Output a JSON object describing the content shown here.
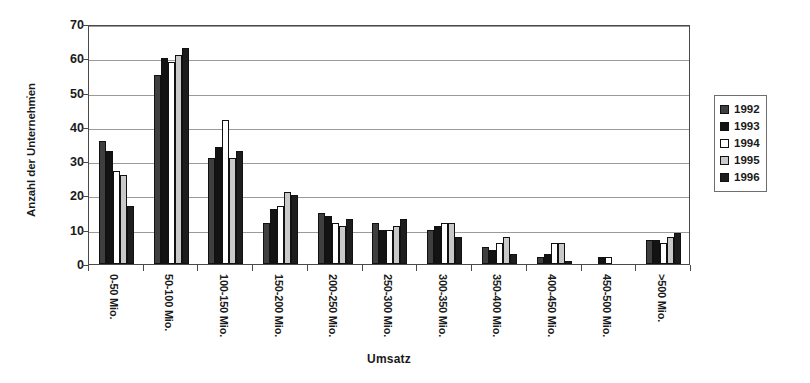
{
  "chart_data": {
    "type": "bar",
    "title": "",
    "xlabel": "Umsatz",
    "ylabel": "Anzahl der Unternehmen",
    "ylim": [
      0,
      70
    ],
    "yticks": [
      0,
      10,
      20,
      30,
      40,
      50,
      60,
      70
    ],
    "grid": true,
    "legend_position": "right",
    "categories": [
      "0-50 Mio.",
      "50-100 Mio.",
      "100-150 Mio.",
      "150-200 Mio.",
      "200-250 Mio.",
      "250-300 Mio.",
      "300-350 Mio.",
      "350-400 Mio.",
      "400-450 Mio.",
      "450-500 Mio.",
      ">500 Mio."
    ],
    "series": [
      {
        "name": "1992",
        "color": "#3f3f3f",
        "values": [
          36,
          55,
          31,
          12,
          15,
          12,
          10,
          5,
          2,
          0,
          7
        ]
      },
      {
        "name": "1993",
        "color": "#131313",
        "values": [
          33,
          60,
          34,
          16,
          14,
          10,
          11,
          4,
          3,
          2,
          7
        ]
      },
      {
        "name": "1994",
        "color": "#ffffff",
        "values": [
          27,
          59,
          42,
          17,
          12,
          10,
          12,
          6,
          6,
          2,
          6
        ]
      },
      {
        "name": "1995",
        "color": "#c9c9c9",
        "values": [
          26,
          61,
          31,
          21,
          11,
          11,
          12,
          8,
          6,
          0,
          8
        ]
      },
      {
        "name": "1996",
        "color": "#1d1d1d",
        "values": [
          17,
          63,
          33,
          20,
          13,
          13,
          8,
          3,
          1,
          0,
          9
        ]
      }
    ]
  },
  "axes": {
    "y_title": "Anzahl der Unternehmen",
    "x_title": "Umsatz",
    "y_tick_labels": [
      "70",
      "60",
      "50",
      "40",
      "30",
      "20",
      "10",
      "0"
    ]
  },
  "legend": {
    "items": [
      {
        "label": "1992",
        "swatch": "y1992"
      },
      {
        "label": "1993",
        "swatch": "y1993"
      },
      {
        "label": "1994",
        "swatch": "y1994"
      },
      {
        "label": "1995",
        "swatch": "y1995"
      },
      {
        "label": "1996",
        "swatch": "y1996"
      }
    ]
  }
}
